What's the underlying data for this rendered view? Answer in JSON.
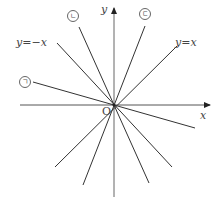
{
  "diagram": {
    "origin_label": "O",
    "x_axis_label": "x",
    "y_axis_label": "y",
    "lines": [
      {
        "id": "y_eq_x",
        "label": "y=x",
        "end1": [
          177,
          46
        ],
        "end2": [
          55,
          167
        ]
      },
      {
        "id": "y_eq_neg_x",
        "label": "y=−x",
        "end1": [
          57,
          43
        ],
        "end2": [
          172,
          167
        ]
      },
      {
        "id": "giyeok",
        "label": "㉠",
        "end1": [
          33,
          82
        ],
        "end2": [
          195,
          128
        ]
      },
      {
        "id": "nieun",
        "label": "㉡",
        "end1": [
          79,
          27
        ],
        "end2": [
          149,
          183
        ]
      },
      {
        "id": "digeut",
        "label": "㉢",
        "end1": [
          145,
          26
        ],
        "end2": [
          83,
          185
        ]
      }
    ],
    "labels": {
      "y_eq_x": "y=x",
      "y_eq_neg_x": "y=−x",
      "giyeok": "ㄱ",
      "nieun": "ㄴ",
      "digeut": "ㄷ"
    },
    "colors": {
      "line": "#333333",
      "axis": "#555555",
      "text": "#444444"
    }
  }
}
